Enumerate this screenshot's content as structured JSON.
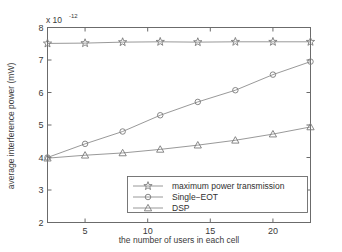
{
  "chart_data": {
    "type": "line",
    "title": "",
    "xlabel": "the number of users in each cell",
    "ylabel": "average interference power (mW)",
    "y_exponent_label": "x 10",
    "y_exponent_value": "-12",
    "xlim": [
      2,
      23
    ],
    "ylim": [
      2,
      8
    ],
    "xticks": [
      5,
      10,
      15,
      20
    ],
    "yticks": [
      2,
      3,
      4,
      5,
      6,
      7,
      8
    ],
    "xtick_labels": [
      "5",
      "10",
      "15",
      "20"
    ],
    "ytick_labels": [
      "2",
      "3",
      "4",
      "5",
      "6",
      "7",
      "8"
    ],
    "grid": false,
    "legend_position": "lower right",
    "x": [
      2,
      5,
      8,
      11,
      14,
      17,
      20,
      23
    ],
    "series": [
      {
        "name": "maximum power transmission",
        "marker": "star",
        "values": [
          7.51,
          7.52,
          7.55,
          7.56,
          7.55,
          7.56,
          7.56,
          7.56
        ]
      },
      {
        "name": "Single−EOT",
        "marker": "circle",
        "values": [
          4.0,
          4.42,
          4.8,
          5.3,
          5.71,
          6.07,
          6.55,
          6.95
        ]
      },
      {
        "name": "DSP",
        "marker": "triangle",
        "values": [
          3.98,
          4.07,
          4.14,
          4.25,
          4.38,
          4.53,
          4.72,
          4.94
        ]
      }
    ],
    "colors": {
      "axis": "#6b6b6b",
      "line": "#8d8d8d",
      "marker": "#7a7a7a",
      "text": "#3a3a3a",
      "background": "#ffffff"
    }
  },
  "axis": {
    "exponent_prefix": "x 10",
    "exponent_power": "-12",
    "x_title": "the number of users in each cell",
    "y_title": "average interference power (mW)"
  },
  "legend": {
    "entries": [
      "maximum power transmission",
      "Single−EOT",
      "DSP"
    ]
  }
}
